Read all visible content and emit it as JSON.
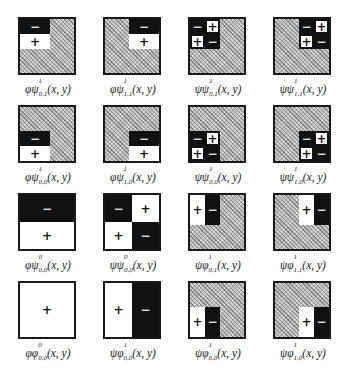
{
  "figure": {
    "title": "",
    "colors": {
      "negative": "#111111",
      "positive": "#ffffff",
      "hatch": "#bdbdbd",
      "border": "#1a1a1a"
    },
    "cells": [
      {
        "row": 0,
        "col": 0,
        "label": {
          "prefix": "φψ",
          "sup": "1",
          "sub": "0,1",
          "args": "(x, y)"
        },
        "region": "top-left",
        "pattern": "horizontal",
        "signs": [
          "−",
          "+"
        ]
      },
      {
        "row": 0,
        "col": 1,
        "label": {
          "prefix": "φψ",
          "sup": "1",
          "sub": "1,1",
          "args": "(x, y)"
        },
        "region": "top-right",
        "pattern": "horizontal",
        "signs": [
          "−",
          "+"
        ]
      },
      {
        "row": 0,
        "col": 2,
        "label": {
          "prefix": "ψψ",
          "sup": "1",
          "sub": "0,1",
          "args": "(x, y)"
        },
        "region": "top-left",
        "pattern": "checker",
        "signs": [
          "−",
          "+",
          "+",
          "−"
        ]
      },
      {
        "row": 0,
        "col": 3,
        "label": {
          "prefix": "ψψ",
          "sup": "1",
          "sub": "1,1",
          "args": "(x, y)"
        },
        "region": "top-right",
        "pattern": "checker",
        "signs": [
          "−",
          "+",
          "+",
          "−"
        ]
      },
      {
        "row": 1,
        "col": 0,
        "label": {
          "prefix": "φψ",
          "sup": "1",
          "sub": "0,0",
          "args": "(x, y)"
        },
        "region": "bottom-left",
        "pattern": "horizontal",
        "signs": [
          "−",
          "+"
        ]
      },
      {
        "row": 1,
        "col": 1,
        "label": {
          "prefix": "φψ",
          "sup": "1",
          "sub": "1,0",
          "args": "(x, y)"
        },
        "region": "bottom-right",
        "pattern": "horizontal",
        "signs": [
          "−",
          "+"
        ]
      },
      {
        "row": 1,
        "col": 2,
        "label": {
          "prefix": "ψψ",
          "sup": "1",
          "sub": "0,0",
          "args": "(x, y)"
        },
        "region": "bottom-left",
        "pattern": "checker",
        "signs": [
          "−",
          "+",
          "+",
          "−"
        ]
      },
      {
        "row": 1,
        "col": 3,
        "label": {
          "prefix": "ψψ",
          "sup": "1",
          "sub": "1,0",
          "args": "(x, y)"
        },
        "region": "bottom-right",
        "pattern": "checker",
        "signs": [
          "−",
          "+",
          "+",
          "−"
        ]
      },
      {
        "row": 2,
        "col": 0,
        "label": {
          "prefix": "φψ",
          "sup": "0",
          "sub": "0,0",
          "args": "(x, y)"
        },
        "region": "full",
        "pattern": "horizontal",
        "signs": [
          "−",
          "+"
        ]
      },
      {
        "row": 2,
        "col": 1,
        "label": {
          "prefix": "ψψ",
          "sup": "0",
          "sub": "0,0",
          "args": "(x, y)"
        },
        "region": "full",
        "pattern": "checker",
        "signs": [
          "−",
          "+",
          "+",
          "−"
        ]
      },
      {
        "row": 2,
        "col": 2,
        "label": {
          "prefix": "ψφ",
          "sup": "1",
          "sub": "0,1",
          "args": "(x, y)"
        },
        "region": "top-left",
        "pattern": "vertical",
        "signs": [
          "+",
          "−"
        ]
      },
      {
        "row": 2,
        "col": 3,
        "label": {
          "prefix": "ψφ",
          "sup": "1",
          "sub": "1,1",
          "args": "(x, y)"
        },
        "region": "top-right",
        "pattern": "vertical",
        "signs": [
          "+",
          "−"
        ]
      },
      {
        "row": 3,
        "col": 0,
        "label": {
          "prefix": "φφ",
          "sup": "0",
          "sub": "0,0",
          "args": "(x, y)"
        },
        "region": "full",
        "pattern": "solid",
        "signs": [
          "+"
        ]
      },
      {
        "row": 3,
        "col": 1,
        "label": {
          "prefix": "ψφ",
          "sup": "1",
          "sub": "0,0",
          "args": "(x, y)"
        },
        "region": "full",
        "pattern": "vertical",
        "signs": [
          "+",
          "−"
        ]
      },
      {
        "row": 3,
        "col": 2,
        "label": {
          "prefix": "ψφ",
          "sup": "1",
          "sub": "0,0",
          "args": "(x, y)"
        },
        "region": "bottom-left",
        "pattern": "vertical",
        "signs": [
          "+",
          "−"
        ]
      },
      {
        "row": 3,
        "col": 3,
        "label": {
          "prefix": "ψφ",
          "sup": "1",
          "sub": "1,0",
          "args": "(x, y)"
        },
        "region": "bottom-right",
        "pattern": "vertical",
        "signs": [
          "+",
          "−"
        ]
      }
    ]
  }
}
